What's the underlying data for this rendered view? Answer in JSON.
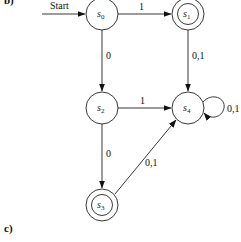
{
  "part_labels": {
    "top": "b)",
    "bottom": "c)"
  },
  "start_label": "Start",
  "states": [
    {
      "id": "s0",
      "name": "s",
      "sub": "0",
      "cx": 102,
      "cy": 14,
      "final": false
    },
    {
      "id": "s1",
      "name": "s",
      "sub": "1",
      "cx": 188,
      "cy": 14,
      "final": true
    },
    {
      "id": "s2",
      "name": "s",
      "sub": "2",
      "cx": 102,
      "cy": 108,
      "final": false
    },
    {
      "id": "s3",
      "name": "s",
      "sub": "3",
      "cx": 102,
      "cy": 205,
      "final": true
    },
    {
      "id": "s4",
      "name": "s",
      "sub": "4",
      "cx": 188,
      "cy": 108,
      "final": false
    }
  ],
  "transitions": [
    {
      "from": "s0",
      "to": "s1",
      "label": "1"
    },
    {
      "from": "s0",
      "to": "s2",
      "label": "0"
    },
    {
      "from": "s1",
      "to": "s4",
      "label": "0,1"
    },
    {
      "from": "s2",
      "to": "s4",
      "label": "1"
    },
    {
      "from": "s2",
      "to": "s3",
      "label": "0"
    },
    {
      "from": "s3",
      "to": "s4",
      "label": "0,1"
    },
    {
      "from": "s4",
      "to": "s4",
      "label": "0,1"
    }
  ]
}
